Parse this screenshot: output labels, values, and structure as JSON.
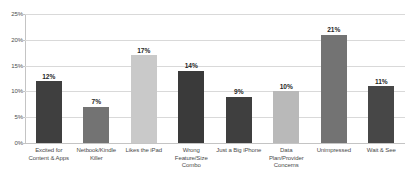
{
  "chart_data": {
    "type": "bar",
    "title": "",
    "subtitle": "",
    "xlabel": "",
    "ylabel": "",
    "ylim": [
      0,
      25
    ],
    "ytick_labels": [
      "0%",
      "5%",
      "10%",
      "15%",
      "20%",
      "25%"
    ],
    "ytick_values": [
      0,
      5,
      10,
      15,
      20,
      25
    ],
    "grid": true,
    "legend": "none",
    "value_label_suffix": "%",
    "categories": [
      "Excited for Content & Apps",
      "Netbook/Kindle Killer",
      "Likes the iPad",
      "Wrong Feature/Size Combo",
      "Just a Big iPhone",
      "Data Plan/Provider Concerns",
      "Unimpressed",
      "Wait & See"
    ],
    "values": [
      12,
      7,
      17,
      14,
      9,
      10,
      21,
      11
    ],
    "value_labels": [
      "12%",
      "7%",
      "17%",
      "14%",
      "9%",
      "10%",
      "21%",
      "11%"
    ],
    "bar_colors": [
      "#3f3f3f",
      "#737373",
      "#c9c9c9",
      "#3a3a3a",
      "#3f3f3f",
      "#b9b9b9",
      "#737373",
      "#474747"
    ]
  },
  "style": {
    "background": "#ffffff",
    "gridline_color": "#d9d9d9",
    "axis_color": "#c4c4c4",
    "tick_text_color": "#4d4d4d",
    "value_text_color": "#262626",
    "category_text_color": "#4a4a4a"
  }
}
